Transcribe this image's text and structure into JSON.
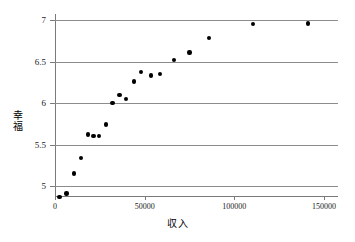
{
  "chart_data": {
    "type": "scatter",
    "title": "",
    "xlabel": "収入",
    "ylabel": "幸福",
    "xlim": [
      0,
      150000
    ],
    "ylim": [
      4.8,
      7.05
    ],
    "xticks": [
      0,
      50000,
      100000,
      150000
    ],
    "xtick_labels": [
      "0",
      "50000",
      "100000",
      "150000"
    ],
    "yticks": [
      5,
      5.5,
      6,
      6.5,
      7
    ],
    "ytick_labels": [
      "5",
      "5.5",
      "6",
      "6.5",
      "7"
    ],
    "grid": "horizontal",
    "legend": "none",
    "marker_color": "#000000",
    "grid_color": "#8c8c8c",
    "axis_color": "#7a7a7a",
    "points": [
      {
        "x": 2500,
        "y": 4.87
      },
      {
        "x": 6500,
        "y": 4.91
      },
      {
        "x": 10500,
        "y": 5.15
      },
      {
        "x": 14500,
        "y": 5.34
      },
      {
        "x": 18500,
        "y": 5.62
      },
      {
        "x": 21500,
        "y": 5.6
      },
      {
        "x": 24500,
        "y": 5.6
      },
      {
        "x": 28500,
        "y": 5.74
      },
      {
        "x": 32000,
        "y": 6.0
      },
      {
        "x": 36000,
        "y": 6.1
      },
      {
        "x": 39500,
        "y": 6.05
      },
      {
        "x": 44000,
        "y": 6.26
      },
      {
        "x": 48000,
        "y": 6.37
      },
      {
        "x": 53500,
        "y": 6.33
      },
      {
        "x": 58500,
        "y": 6.35
      },
      {
        "x": 66500,
        "y": 6.52
      },
      {
        "x": 75000,
        "y": 6.61
      },
      {
        "x": 86000,
        "y": 6.78
      },
      {
        "x": 110500,
        "y": 6.95
      },
      {
        "x": 141000,
        "y": 6.96
      }
    ]
  }
}
